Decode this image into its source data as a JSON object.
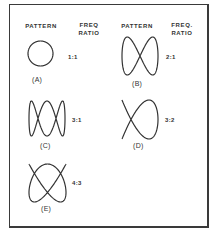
{
  "headers": {
    "left_pattern": "PATTERN",
    "left_freq": "FREQ",
    "left_ratio": "RATIO",
    "right_pattern": "PATTERN",
    "right_freq": "FREQ.",
    "right_ratio": "RATIO"
  },
  "patterns": [
    {
      "id": "A",
      "caption": "(A)",
      "ratio": "1:1",
      "fx": 1,
      "fy": 1,
      "phase": 1.5708
    },
    {
      "id": "B",
      "caption": "(B)",
      "ratio": "2:1",
      "fx": 1,
      "fy": 2,
      "phase": 0
    },
    {
      "id": "C",
      "caption": "(C)",
      "ratio": "3:1",
      "fx": 1,
      "fy": 3,
      "phase": 1.5708
    },
    {
      "id": "D",
      "caption": "(D)",
      "ratio": "3:2",
      "fx": 2,
      "fy": 3,
      "phase": 1.5708
    },
    {
      "id": "E",
      "caption": "(E)",
      "ratio": "4:3",
      "fx": 3,
      "fy": 4,
      "phase": 0.3927
    }
  ],
  "colors": {
    "stroke": "#333333",
    "border": "#3a3a3a",
    "background": "#ffffff"
  }
}
